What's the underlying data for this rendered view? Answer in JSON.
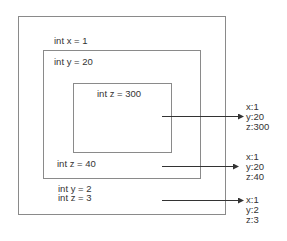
{
  "diagram": {
    "outer_scope": {
      "declarations": [
        "int x = 1"
      ],
      "trailing_declarations": [
        "int y = 2",
        "int z = 3"
      ]
    },
    "middle_scope": {
      "declarations": [
        "int y = 20"
      ],
      "trailing_declarations": [
        "int z = 40"
      ]
    },
    "inner_scope": {
      "declarations": [
        "int z = 300"
      ]
    },
    "results": [
      {
        "lines": [
          "x:1",
          "y:20",
          "z:300"
        ]
      },
      {
        "lines": [
          "x:1",
          "y:20",
          "z:40"
        ]
      },
      {
        "lines": [
          "x:1",
          "y:2",
          "z:3"
        ]
      }
    ],
    "colors": {
      "box_border": "#8a8a8a",
      "arrow": "#333333",
      "text": "#333333"
    }
  }
}
